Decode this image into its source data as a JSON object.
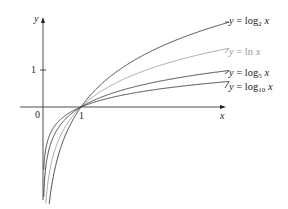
{
  "chart_data": {
    "type": "line",
    "title": "",
    "xlabel": "x",
    "ylabel": "y",
    "x_ticks": [
      "0",
      "1"
    ],
    "y_ticks": [
      "1"
    ],
    "grid": false,
    "legend_position": "inline-right",
    "domain_x": [
      0.02,
      4.9
    ],
    "series": [
      {
        "name": "y = log2 x",
        "base": 2,
        "color": "#333333",
        "label_parts": {
          "pre": "y = log",
          "sub": "2",
          "post": " x"
        }
      },
      {
        "name": "y = ln x",
        "base": 2.718281828,
        "color": "#9a9a9a",
        "label_parts": {
          "pre": "y = ln",
          "sub": "",
          "post": " x"
        }
      },
      {
        "name": "y = log5 x",
        "base": 5,
        "color": "#333333",
        "label_parts": {
          "pre": "y = log",
          "sub": "5",
          "post": " x"
        }
      },
      {
        "name": "y = log10 x",
        "base": 10,
        "color": "#333333",
        "label_parts": {
          "pre": "y = log",
          "sub": "10",
          "post": " x"
        }
      }
    ],
    "annotations": [
      "All curves pass through (1, 0)"
    ]
  },
  "labels": {
    "x_axis": "x",
    "y_axis": "y",
    "origin": "0",
    "x_tick_1": "1",
    "y_tick_1": "1"
  }
}
